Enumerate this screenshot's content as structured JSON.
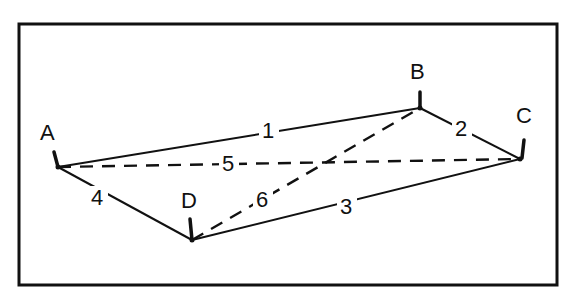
{
  "diagram": {
    "type": "network-graph",
    "frame": {
      "x": 19,
      "y": 24,
      "width": 538,
      "height": 261
    },
    "nodes": [
      {
        "id": "A",
        "label": "A",
        "x": 58,
        "y": 167,
        "label_x": 48,
        "label_y": 140,
        "tick": [
          [
            54,
            152
          ],
          [
            58,
            167
          ]
        ]
      },
      {
        "id": "B",
        "label": "B",
        "x": 420,
        "y": 108,
        "label_x": 418,
        "label_y": 79,
        "tick": [
          [
            420,
            92
          ],
          [
            420,
            108
          ]
        ]
      },
      {
        "id": "C",
        "label": "C",
        "x": 520,
        "y": 159,
        "label_x": 524,
        "label_y": 123,
        "tick": [
          [
            524,
            140
          ],
          [
            522,
            158
          ]
        ]
      },
      {
        "id": "D",
        "label": "D",
        "x": 192,
        "y": 240,
        "label_x": 189,
        "label_y": 208,
        "tick": [
          [
            190,
            219
          ],
          [
            192,
            240
          ]
        ]
      }
    ],
    "edges": [
      {
        "id": "1",
        "label": "1",
        "from": "A",
        "to": "B",
        "style": "solid",
        "label_x": 268,
        "label_y": 138
      },
      {
        "id": "2",
        "label": "2",
        "from": "B",
        "to": "C",
        "style": "solid",
        "label_x": 461,
        "label_y": 136
      },
      {
        "id": "3",
        "label": "3",
        "from": "D",
        "to": "C",
        "style": "solid",
        "label_x": 346,
        "label_y": 214
      },
      {
        "id": "4",
        "label": "4",
        "from": "A",
        "to": "D",
        "style": "solid",
        "label_x": 97,
        "label_y": 205
      },
      {
        "id": "5",
        "label": "5",
        "from": "A",
        "to": "C",
        "style": "dashed",
        "label_x": 228,
        "label_y": 171
      },
      {
        "id": "6",
        "label": "6",
        "from": "D",
        "to": "B",
        "style": "dashed",
        "label_x": 262,
        "label_y": 207
      }
    ]
  }
}
